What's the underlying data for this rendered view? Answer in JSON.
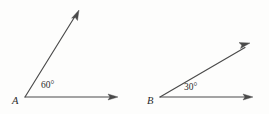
{
  "figure": {
    "background_color": "#fdfdfc",
    "line_color": "#4a4a4a",
    "text_color": "#2b2b2b",
    "width": 269,
    "height": 114,
    "angles": [
      {
        "id": "angle-a",
        "vertex_label": "A",
        "measure_label": "60°",
        "measure_value": 60,
        "vertex": {
          "x": 25,
          "y": 97
        },
        "horizontal_ray": {
          "x": 118,
          "y": 97
        },
        "slanted_ray": {
          "x": 78,
          "y": 10
        },
        "vertex_label_pos": {
          "x": 12,
          "y": 104
        },
        "measure_label_pos": {
          "x": 41,
          "y": 88
        }
      },
      {
        "id": "angle-b",
        "vertex_label": "B",
        "measure_label": "30°",
        "measure_value": 30,
        "vertex": {
          "x": 160,
          "y": 97
        },
        "horizontal_ray": {
          "x": 253,
          "y": 97
        },
        "slanted_ray": {
          "x": 250,
          "y": 43
        },
        "vertex_label_pos": {
          "x": 147,
          "y": 104
        },
        "measure_label_pos": {
          "x": 184,
          "y": 90
        }
      }
    ]
  }
}
